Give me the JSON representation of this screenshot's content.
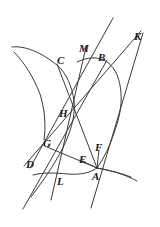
{
  "figure": {
    "width": 160,
    "height": 227,
    "background_color": "#ffffff",
    "stroke_color": "#3a3a3a",
    "label_color": "#1a1a1a",
    "label_style": "italic-serif"
  },
  "labels": [
    {
      "id": "label-C",
      "text": "C",
      "x": 57,
      "y": 55
    },
    {
      "id": "label-M",
      "text": "M",
      "x": 79,
      "y": 43
    },
    {
      "id": "label-B",
      "text": "B",
      "x": 98,
      "y": 52
    },
    {
      "id": "label-K",
      "text": "K",
      "x": 134,
      "y": 31
    },
    {
      "id": "label-H",
      "text": "H",
      "x": 59,
      "y": 108
    },
    {
      "id": "label-G",
      "text": "G",
      "x": 43,
      "y": 138
    },
    {
      "id": "label-F",
      "text": "F",
      "x": 95,
      "y": 142
    },
    {
      "id": "label-E",
      "text": "E",
      "x": 79,
      "y": 154
    },
    {
      "id": "label-D",
      "text": "D",
      "x": 26,
      "y": 159
    },
    {
      "id": "label-A",
      "text": "A",
      "x": 92,
      "y": 171
    },
    {
      "id": "label-L",
      "text": "L",
      "x": 57,
      "y": 176
    }
  ],
  "curves": [
    {
      "id": "curve-left-branch",
      "name": "left-hyperbola-branch",
      "description": "Upper-left branch passing near C, opening up-left and down-left",
      "path": "M 12 47 C 28 45 46 56 58 66 C 66 73 72 86 74 101 C 76 116 70 136 58 157 C 50 171 40 185 31 197"
    },
    {
      "id": "curve-left-branch-lower",
      "name": "left-branch-lower-asymptotic-arm",
      "description": "Lower-left arm of the left branch continuing from the waist down to the lower-left",
      "path": "M 14 52 C 24 62 34 78 40 94 C 45 110 46 126 44 140"
    },
    {
      "id": "curve-right-branch-upper",
      "name": "right-hyperbola-branch-upper-arm",
      "description": "Right branch upper arm rising toward B and beyond the top-right",
      "path": "M 77 62 C 88 57 98 56 107 62 C 116 68 120 80 121 93 C 122 106 119 120 114 133"
    },
    {
      "id": "curve-right-branch-lower",
      "name": "right-hyperbola-branch-lower-arm",
      "description": "Right branch lower arm descending past A toward the bottom-right",
      "path": "M 114 133 C 110 146 104 158 97 168 C 106 170 118 172 131 177"
    },
    {
      "id": "curve-bottom-arc",
      "name": "lower-conic-arc-through-L-and-A",
      "description": "Lower arc sweeping from the left side through L up to A",
      "path": "M 33 175 C 44 172 56 173 68 174 C 80 175 90 173 97 168"
    },
    {
      "id": "curve-A-tail",
      "name": "arc-tail-right-of-A",
      "description": "Short arc leaving A toward the lower right",
      "path": "M 97 168 C 110 170 124 174 137 181"
    }
  ],
  "lines": [
    {
      "id": "line-C-A",
      "name": "chord-C-to-A",
      "x1": 57,
      "y1": 64,
      "x2": 97,
      "y2": 168
    },
    {
      "id": "line-M-L",
      "name": "chord-M-to-L",
      "x1": 86,
      "y1": 47,
      "x2": 51,
      "y2": 200
    },
    {
      "id": "line-K-D",
      "name": "chord-K-to-D",
      "x1": 141,
      "y1": 31,
      "x2": 24,
      "y2": 166
    },
    {
      "id": "line-K-A",
      "name": "chord-K-to-A",
      "x1": 143,
      "y1": 33,
      "x2": 91,
      "y2": 208
    },
    {
      "id": "line-B-G",
      "name": "chord-B-to-G-to-left",
      "x1": 107,
      "y1": 60,
      "x2": 23,
      "y2": 209
    },
    {
      "id": "line-D-B",
      "name": "line-D-through-F-to-B",
      "x1": 30,
      "y1": 168,
      "x2": 113,
      "y2": 18
    },
    {
      "id": "line-G-A",
      "name": "segment-G-to-A",
      "x1": 47,
      "y1": 147,
      "x2": 97,
      "y2": 168
    },
    {
      "id": "line-E-A",
      "name": "segment-E-to-A",
      "x1": 80,
      "y1": 160,
      "x2": 97,
      "y2": 168
    },
    {
      "id": "line-F-A",
      "name": "segment-F-to-A",
      "x1": 99,
      "y1": 150,
      "x2": 97,
      "y2": 168
    }
  ]
}
